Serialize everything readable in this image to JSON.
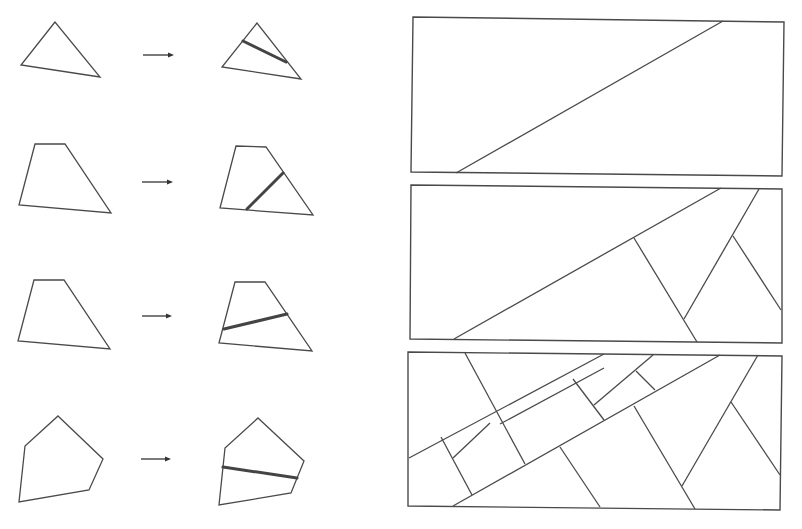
{
  "colors": {
    "background": "#ffffff",
    "stroke": "#4a4a4a",
    "cut_stroke": "#444444"
  },
  "left_panel": {
    "rows": [
      {
        "name": "triangle",
        "source": [
          [
            55,
            22
          ],
          [
            21,
            65
          ],
          [
            100,
            77
          ]
        ],
        "arrow": {
          "x1": 143,
          "x2": 174,
          "y": 55
        },
        "result": [
          [
            257,
            23
          ],
          [
            222,
            67
          ],
          [
            301,
            79
          ]
        ],
        "cut": [
          [
            243,
            41
          ],
          [
            286,
            62
          ]
        ]
      },
      {
        "name": "quadrilateral-a",
        "source": [
          [
            35,
            144
          ],
          [
            65,
            144
          ],
          [
            111,
            213
          ],
          [
            19,
            205
          ]
        ],
        "arrow": {
          "x1": 142,
          "x2": 173,
          "y": 182
        },
        "result": [
          [
            236,
            146
          ],
          [
            266,
            147
          ],
          [
            313,
            215
          ],
          [
            220,
            208
          ]
        ],
        "cut": [
          [
            283,
            173
          ],
          [
            247,
            209
          ]
        ]
      },
      {
        "name": "quadrilateral-b",
        "source": [
          [
            34,
            280
          ],
          [
            64,
            280
          ],
          [
            110,
            349
          ],
          [
            18,
            341
          ]
        ],
        "arrow": {
          "x1": 142,
          "x2": 172,
          "y": 316
        },
        "result": [
          [
            235,
            282
          ],
          [
            265,
            282
          ],
          [
            312,
            351
          ],
          [
            219,
            343
          ]
        ],
        "cut": [
          [
            224,
            329
          ],
          [
            287,
            314
          ]
        ]
      },
      {
        "name": "pentagon",
        "source": [
          [
            58,
            416
          ],
          [
            103,
            459
          ],
          [
            89,
            490
          ],
          [
            19,
            502
          ],
          [
            25,
            446
          ]
        ],
        "arrow": {
          "x1": 141,
          "x2": 171,
          "y": 459
        },
        "result": [
          [
            258,
            418
          ],
          [
            304,
            461
          ],
          [
            291,
            493
          ],
          [
            219,
            505
          ],
          [
            225,
            448
          ]
        ],
        "cut": [
          [
            223,
            467
          ],
          [
            297,
            478
          ]
        ]
      }
    ]
  },
  "right_panel": {
    "rectangles": [
      {
        "name": "rectangle-step-1",
        "outline": [
          [
            413,
            17
          ],
          [
            784,
            22
          ],
          [
            782,
            176
          ],
          [
            411,
            172
          ]
        ],
        "lines": [
          [
            [
              723,
              21
            ],
            [
              456,
              173
            ]
          ]
        ]
      },
      {
        "name": "rectangle-step-2",
        "outline": [
          [
            411,
            185
          ],
          [
            782,
            189
          ],
          [
            782,
            343
          ],
          [
            410,
            339
          ]
        ],
        "lines": [
          [
            [
              721,
              188
            ],
            [
              454,
              339
            ]
          ],
          [
            [
              634,
              238
            ],
            [
              697,
              342
            ]
          ],
          [
            [
              759,
              189
            ],
            [
              684,
              319
            ]
          ],
          [
            [
              733,
              236
            ],
            [
              781,
              310
            ]
          ]
        ]
      },
      {
        "name": "rectangle-step-3",
        "outline": [
          [
            408,
            352
          ],
          [
            782,
            356
          ],
          [
            780,
            510
          ],
          [
            408,
            506
          ]
        ],
        "lines": [
          [
            [
              720,
              355
            ],
            [
              453,
              506
            ]
          ],
          [
            [
              634,
              406
            ],
            [
              695,
              509
            ]
          ],
          [
            [
              758,
              355
            ],
            [
              682,
              486
            ]
          ],
          [
            [
              731,
              402
            ],
            [
              780,
              475
            ]
          ],
          [
            [
              604,
              354
            ],
            [
              409,
              458
            ]
          ],
          [
            [
              465,
              353
            ],
            [
              525,
              464
            ]
          ],
          [
            [
              441,
              437
            ],
            [
              472,
              495
            ]
          ],
          [
            [
              490,
              423
            ],
            [
              453,
              458
            ]
          ],
          [
            [
              500,
              424
            ],
            [
              604,
              368
            ]
          ],
          [
            [
              573,
              379
            ],
            [
              604,
              420
            ]
          ],
          [
            [
              653,
              355
            ],
            [
              594,
              405
            ]
          ],
          [
            [
              636,
              371
            ],
            [
              655,
              390
            ]
          ],
          [
            [
              560,
              447
            ],
            [
              600,
              507
            ]
          ]
        ]
      }
    ]
  }
}
